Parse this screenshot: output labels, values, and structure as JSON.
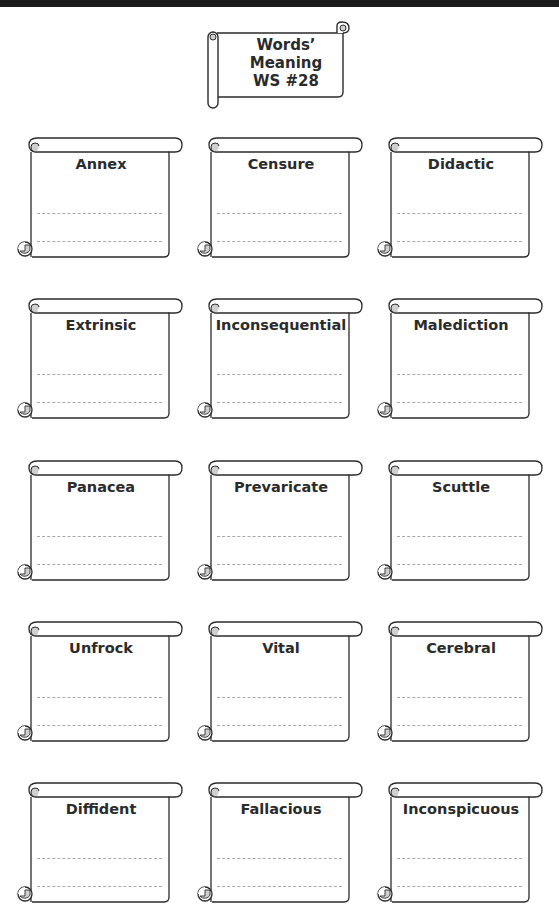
{
  "top_bar": {
    "text": ""
  },
  "title": {
    "line1": "Words’",
    "line2": "Meaning",
    "line3": "WS #28"
  },
  "colors": {
    "ink": "#2b2b2b",
    "dash": "#a8a8a8",
    "curl_fill": "#cfcfcf"
  },
  "cards": [
    {
      "word": "Annex"
    },
    {
      "word": "Censure"
    },
    {
      "word": "Didactic"
    },
    {
      "word": "Extrinsic"
    },
    {
      "word": "Inconsequential"
    },
    {
      "word": "Malediction"
    },
    {
      "word": "Panacea"
    },
    {
      "word": "Prevaricate"
    },
    {
      "word": "Scuttle"
    },
    {
      "word": "Unfrock"
    },
    {
      "word": "Vital"
    },
    {
      "word": "Cerebral"
    },
    {
      "word": "Diffident"
    },
    {
      "word": "Fallacious"
    },
    {
      "word": "Inconspicuous"
    }
  ]
}
